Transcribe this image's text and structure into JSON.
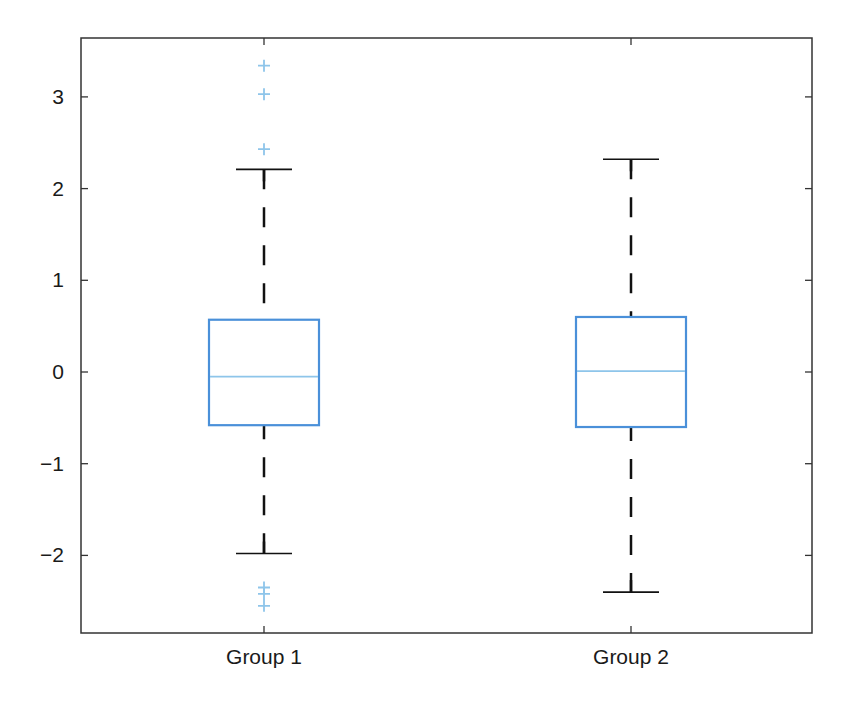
{
  "chart_data": {
    "type": "box",
    "title": "",
    "xlabel": "",
    "ylabel": "",
    "ylim": [
      -2.85,
      3.65
    ],
    "yticks": [
      -2,
      -1,
      0,
      1,
      2,
      3
    ],
    "ytick_labels": [
      "−2",
      "−1",
      "0",
      "1",
      "2",
      "3"
    ],
    "grid": false,
    "categories": [
      "Group 1",
      "Group 2"
    ],
    "series": [
      {
        "name": "Group 1",
        "whisker_low": -1.98,
        "q1": -0.58,
        "median": -0.05,
        "q3": 0.57,
        "whisker_high": 2.21,
        "outliers": [
          3.34,
          3.03,
          2.43,
          -2.35,
          -2.42,
          -2.55
        ]
      },
      {
        "name": "Group 2",
        "whisker_low": -2.4,
        "q1": -0.6,
        "median": 0.01,
        "q3": 0.6,
        "whisker_high": 2.32,
        "outliers": []
      }
    ],
    "colors": {
      "box": "#4a90d9",
      "median": "#8ec5ea",
      "whisker": "#111111",
      "outlier": "#8ec5ea",
      "axis": "#333333"
    }
  }
}
